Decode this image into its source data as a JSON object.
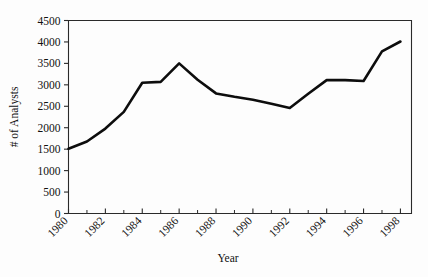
{
  "chart_data": {
    "type": "line",
    "title": "",
    "xlabel": "Year",
    "ylabel": "# of  Analysts",
    "xlim": [
      1980,
      1998.6
    ],
    "ylim": [
      0,
      4500
    ],
    "grid": false,
    "legend": null,
    "x": [
      1980,
      1981,
      1982,
      1983,
      1984,
      1985,
      1986,
      1987,
      1988,
      1989,
      1990,
      1991,
      1992,
      1993,
      1994,
      1995,
      1996,
      1997,
      1998
    ],
    "values": [
      1510,
      1680,
      1980,
      2370,
      3050,
      3070,
      3500,
      3120,
      2800,
      2720,
      2650,
      2560,
      2460,
      2790,
      3110,
      3110,
      3090,
      3780,
      4010
    ],
    "series": [
      {
        "name": "# of Analysts",
        "values": [
          1510,
          1680,
          1980,
          2370,
          3050,
          3070,
          3500,
          3120,
          2800,
          2720,
          2650,
          2560,
          2460,
          2790,
          3110,
          3110,
          3090,
          3780,
          4010
        ]
      }
    ],
    "y_ticks": [
      0,
      500,
      1000,
      1500,
      2000,
      2500,
      3000,
      3500,
      4000,
      4500
    ],
    "y_tick_labels": [
      "0",
      "500",
      "1000",
      "1500",
      "2000",
      "2500",
      "3000",
      "3500",
      "4000",
      "4500"
    ],
    "x_ticks_major": [
      1980,
      1982,
      1984,
      1986,
      1988,
      1990,
      1992,
      1994,
      1996,
      1998
    ],
    "x_tick_labels": [
      "1980",
      "1982",
      "1984",
      "1986",
      "1988",
      "1990",
      "1992",
      "1994",
      "1996",
      "1998"
    ],
    "x_ticks_minor": [
      1981,
      1983,
      1985,
      1987,
      1989,
      1991,
      1993,
      1995,
      1997
    ],
    "line_color": "#0d0d0d",
    "axis_color": "#2a2a2a",
    "background_color": "#fdfdfd"
  }
}
